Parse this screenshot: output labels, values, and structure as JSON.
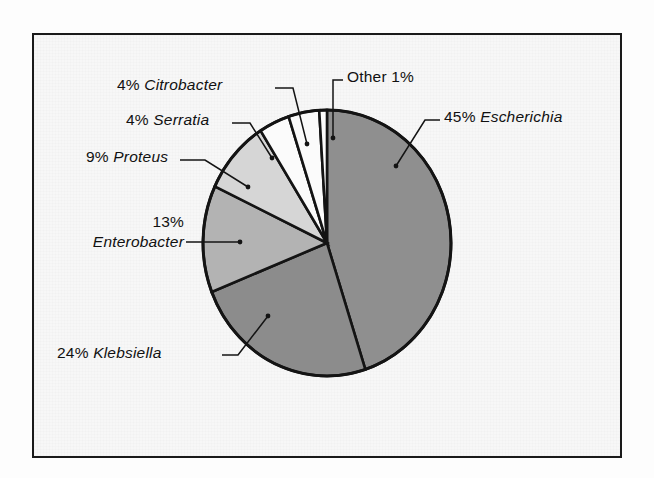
{
  "figure": {
    "background_color": "#f7f7f7",
    "frame_color": "#1a1a1a",
    "outer_color": "#fdfdfd"
  },
  "chart_data": {
    "type": "pie",
    "title": "",
    "subtitle": "",
    "xlabel": "",
    "ylabel": "",
    "legend_position": "none",
    "grid": false,
    "start_angle_deg": 0,
    "direction": "clockwise",
    "total_percent": 100,
    "categories": [
      "Escherichia",
      "Klebsiella",
      "Enterobacter",
      "Proteus",
      "Serratia",
      "Citrobacter",
      "Other"
    ],
    "values": [
      45,
      24,
      13,
      9,
      4,
      4,
      1
    ],
    "units": "percent",
    "slices": [
      {
        "name": "Escherichia",
        "value": 45,
        "percent_text": "45%",
        "label_text": "45% Escherichia",
        "italic_genus": true,
        "fill": "#8f8f8f",
        "start_deg": 0,
        "end_deg": 162
      },
      {
        "name": "Klebsiella",
        "value": 24,
        "percent_text": "24%",
        "label_text": "24% Klebsiella",
        "italic_genus": true,
        "fill": "#8c8c8c",
        "start_deg": 162,
        "end_deg": 248.4
      },
      {
        "name": "Enterobacter",
        "value": 13,
        "percent_text": "13%",
        "label_text": "13% Enterobacter",
        "italic_genus": true,
        "fill": "#b3b3b3",
        "start_deg": 248.4,
        "end_deg": 295.2
      },
      {
        "name": "Proteus",
        "value": 9,
        "percent_text": "9%",
        "label_text": "9% Proteus",
        "italic_genus": true,
        "fill": "#d6d6d6",
        "start_deg": 295.2,
        "end_deg": 327.6
      },
      {
        "name": "Serratia",
        "value": 4,
        "percent_text": "4%",
        "label_text": "4% Serratia",
        "italic_genus": true,
        "fill": "#fbfbfb",
        "start_deg": 327.6,
        "end_deg": 342
      },
      {
        "name": "Citrobacter",
        "value": 4,
        "percent_text": "4%",
        "label_text": "4% Citrobacter",
        "italic_genus": true,
        "fill": "#fbfbfb",
        "start_deg": 342,
        "end_deg": 356.4
      },
      {
        "name": "Other",
        "value": 1,
        "percent_text": "1%",
        "label_text": "Other 1%",
        "italic_genus": false,
        "fill": "#fbfbfb",
        "start_deg": 356.4,
        "end_deg": 360
      }
    ]
  },
  "labels": {
    "escherichia": {
      "pct": "45%",
      "genus": "Escherichia"
    },
    "klebsiella": {
      "pct": "24%",
      "genus": "Klebsiella"
    },
    "enterobacter": {
      "pct": "13%",
      "genus": "Enterobacter"
    },
    "proteus": {
      "pct": "9%",
      "genus": "Proteus"
    },
    "serratia": {
      "pct": "4%",
      "genus": "Serratia"
    },
    "citrobacter": {
      "pct": "4%",
      "genus": "Citrobacter"
    },
    "other": {
      "name": "Other",
      "pct": "1%"
    }
  }
}
